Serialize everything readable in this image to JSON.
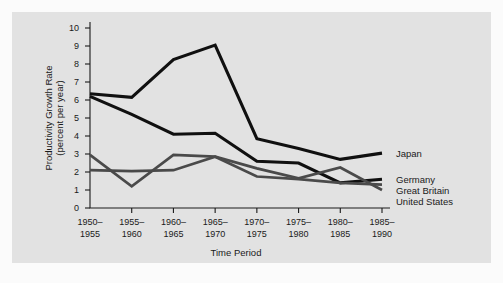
{
  "chart_data": {
    "type": "line",
    "title": "",
    "xlabel": "Time Period",
    "ylabel": "Productivity Growth Rate (percent per year)",
    "ylabel_line1": "Productivity Growth Rate",
    "ylabel_line2": "(percent per year)",
    "ylim": [
      0,
      10
    ],
    "ytick_labels": [
      "0",
      "1",
      "2",
      "3",
      "4",
      "5",
      "6",
      "7",
      "8",
      "9",
      "10"
    ],
    "yticks": [
      0,
      1,
      2,
      3,
      4,
      5,
      6,
      7,
      8,
      9,
      10
    ],
    "grid": false,
    "legend_position": "right-inline",
    "categories": [
      "1950-\n1955",
      "1955-\n1960",
      "1960-\n1965",
      "1965-\n1970",
      "1970-\n1975",
      "1975-\n1980",
      "1980-\n1985",
      "1985-\n1990"
    ],
    "category_lines": [
      {
        "top": "1950–",
        "bottom": "1955"
      },
      {
        "top": "1955–",
        "bottom": "1960"
      },
      {
        "top": "1960–",
        "bottom": "1965"
      },
      {
        "top": "1965–",
        "bottom": "1970"
      },
      {
        "top": "1970–",
        "bottom": "1975"
      },
      {
        "top": "1975–",
        "bottom": "1980"
      },
      {
        "top": "1980–",
        "bottom": "1985"
      },
      {
        "top": "1985–",
        "bottom": "1990"
      }
    ],
    "series": [
      {
        "name": "Japan",
        "color": "#101010",
        "width": 3.1,
        "values": [
          6.35,
          6.15,
          8.25,
          9.05,
          3.85,
          3.3,
          2.7,
          3.05
        ]
      },
      {
        "name": "Germany",
        "color": "#101010",
        "width": 3.1,
        "values": [
          6.2,
          5.2,
          4.1,
          4.15,
          2.6,
          2.5,
          1.4,
          1.6
        ]
      },
      {
        "name": "Great Britain",
        "color": "#4a4a4a",
        "width": 2.7,
        "values": [
          2.95,
          1.2,
          2.95,
          2.85,
          2.2,
          1.65,
          2.25,
          1.0
        ]
      },
      {
        "name": "United States",
        "color": "#4a4a4a",
        "width": 2.7,
        "values": [
          2.1,
          2.05,
          2.1,
          2.85,
          1.75,
          1.6,
          1.4,
          1.3
        ]
      }
    ],
    "annotations": [
      {
        "label": "Japan",
        "value": 3.05
      },
      {
        "label": "Germany",
        "value": 1.6
      },
      {
        "label": "Great Britain",
        "value": 1.0
      },
      {
        "label": "United States",
        "value": 1.3
      }
    ]
  },
  "labels": {
    "japan": "Japan",
    "germany": "Germany",
    "great_britain": "Great Britain",
    "united_states": "United States"
  }
}
